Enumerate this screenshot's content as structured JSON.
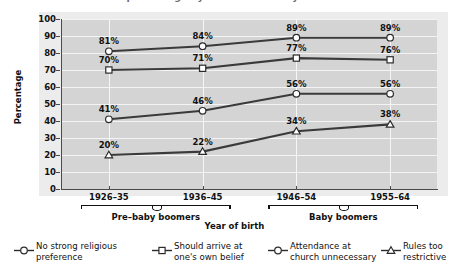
{
  "figure": {
    "title_clipped": "percentage by decade and baby boomer",
    "background": "#ffffff",
    "plot_background": "#d4d4d4",
    "grid_color": "#f4f4f4",
    "line_color": "#3a3a3a"
  },
  "chart_data": {
    "type": "line",
    "title": "",
    "xlabel": "Year of birth",
    "ylabel": "Percentage",
    "categories": [
      "1926–35",
      "1936–45",
      "1946–54",
      "1955–64"
    ],
    "ylim": [
      0,
      100
    ],
    "ytick_step": 10,
    "yticks": [
      "0",
      "10",
      "20",
      "30",
      "40",
      "50",
      "60",
      "70",
      "80",
      "90",
      "100"
    ],
    "grid": true,
    "legend_position": "bottom",
    "series": [
      {
        "name": "No strong religious preference",
        "marker": "circle",
        "values": [
          81,
          84,
          89,
          89
        ],
        "labels": [
          "81%",
          "84%",
          "89%",
          "89%"
        ]
      },
      {
        "name": "Should arrive at one's own belief",
        "marker": "square",
        "values": [
          70,
          71,
          77,
          76
        ],
        "labels": [
          "70%",
          "71%",
          "77%",
          "76%"
        ]
      },
      {
        "name": "Attendance at church unnecessary",
        "marker": "circle",
        "values": [
          41,
          46,
          56,
          56
        ],
        "labels": [
          "41%",
          "46%",
          "56%",
          "56%"
        ]
      },
      {
        "name": "Rules too restrictive",
        "marker": "triangle",
        "values": [
          20,
          22,
          34,
          38
        ],
        "labels": [
          "20%",
          "22%",
          "34%",
          "38%"
        ]
      }
    ],
    "x_groups": [
      {
        "label": "Pre–baby boomers",
        "categories": [
          "1926–35",
          "1936–45"
        ]
      },
      {
        "label": "Baby boomers",
        "categories": [
          "1946–54",
          "1955–64"
        ]
      }
    ]
  },
  "legend": {
    "items": [
      {
        "marker": "circle",
        "line1": "No strong religious",
        "line2": "preference"
      },
      {
        "marker": "square",
        "line1": "Should arrive at",
        "line2": "one's own belief"
      },
      {
        "marker": "circle",
        "line1": "Attendance at",
        "line2": "church unnecessary"
      },
      {
        "marker": "triangle",
        "line1": "Rules too",
        "line2": "restrictive"
      }
    ]
  }
}
